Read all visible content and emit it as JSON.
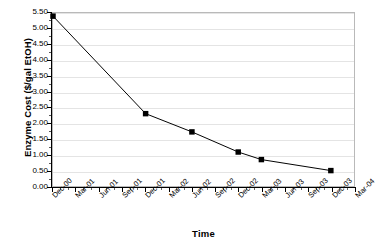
{
  "chart_data": {
    "type": "line",
    "title": "",
    "xlabel": "Time",
    "ylabel": "Enzyme Cost ($/gal EtOH)",
    "categories": [
      "Dec-00",
      "Mar-01",
      "Jun-01",
      "Sep-01",
      "Dec-01",
      "Mar-02",
      "Jun-02",
      "Sep-02",
      "Dec-02",
      "Mar-03",
      "Jun-03",
      "Sep-03",
      "Dec-03",
      "Mar-04"
    ],
    "x_tick_labels": [
      "Dec-00",
      "Mar-01",
      "Jun-01",
      "Sep-01",
      "Dec-01",
      "Mar-02",
      "Jun-02",
      "Sep-02",
      "Dec-02",
      "Mar-03",
      "Jun-03",
      "Sep-03",
      "Dec-03",
      "Mar-04"
    ],
    "y_tick_labels": [
      "0.00",
      "0.50",
      "1.00",
      "1.50",
      "2.00",
      "2.50",
      "3.00",
      "3.50",
      "4.00",
      "4.50",
      "5.00",
      "5.50"
    ],
    "y_tick_values": [
      0.0,
      0.5,
      1.0,
      1.5,
      2.0,
      2.5,
      3.0,
      3.5,
      4.0,
      4.5,
      5.0,
      5.5
    ],
    "ylim": [
      0.0,
      5.5
    ],
    "xlim": [
      0,
      13
    ],
    "grid": true,
    "legend": "none",
    "series": [
      {
        "name": "Enzyme Cost",
        "color": "#000000",
        "marker": "square",
        "points": [
          {
            "x": 0,
            "label": "Dec-00",
            "y": 5.4
          },
          {
            "x": 4,
            "label": "Dec-01",
            "y": 2.3
          },
          {
            "x": 6,
            "label": "Jun-02",
            "y": 1.72
          },
          {
            "x": 8,
            "label": "Dec-02",
            "y": 1.08
          },
          {
            "x": 9,
            "label": "Mar-03",
            "y": 0.84
          },
          {
            "x": 12,
            "label": "Dec-03",
            "y": 0.49
          }
        ]
      }
    ]
  },
  "axes": {
    "y_title": "Enzyme Cost ($/gal EtOH)",
    "x_title": "Time"
  }
}
